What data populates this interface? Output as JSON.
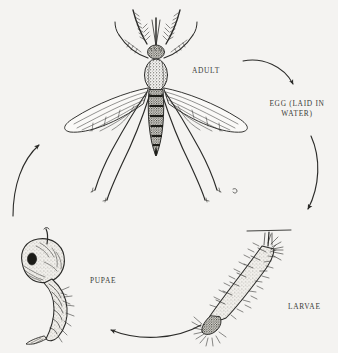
{
  "diagram": {
    "style": "pen-and-ink scientific illustration",
    "background_color": "#f4f3f1",
    "ink_color": "#2b2b29",
    "width": 338,
    "height": 353,
    "cycle_direction": "clockwise"
  },
  "labels": {
    "adult": "ADULT",
    "egg": "EGG (LAID IN\nWATER)",
    "larvae": "LARVAE",
    "pupae": "PUPAE"
  },
  "stages": [
    {
      "id": "adult",
      "label": "ADULT",
      "position": "top-center",
      "description": "Winged adult mosquito viewed from above with plumose antennae, long proboscis, stippled thorax, banded segmented abdomen, two veined wings and six long splayed legs"
    },
    {
      "id": "egg",
      "label": "EGG (LAID IN WATER)",
      "position": "right",
      "description": "Text-only stage label on the right side of the cycle"
    },
    {
      "id": "larvae",
      "label": "LARVAE",
      "position": "bottom-right",
      "description": "Bristly segmented larva hanging head-down at an angle from the horizontal water surface line by its breathing siphon, mouth brushes at the lower end"
    },
    {
      "id": "pupae",
      "label": "PUPAE",
      "position": "bottom-left",
      "description": "Comma-shaped pupa with large rounded cephalothorax bearing a dark eye spot and breathing trumpet, curving bristly abdomen ending in paddles"
    }
  ],
  "arrows": [
    {
      "id": "adult-to-egg",
      "from": "adult",
      "to": "egg",
      "position": "top-right",
      "direction": "curving down to the right"
    },
    {
      "id": "egg-to-larvae",
      "from": "egg",
      "to": "larvae",
      "position": "right",
      "direction": "curving downward"
    },
    {
      "id": "larvae-to-pupae",
      "from": "larvae",
      "to": "pupae",
      "position": "bottom",
      "direction": "curving left"
    },
    {
      "id": "pupae-to-adult",
      "from": "pupae",
      "to": "adult",
      "position": "left",
      "direction": "curving up to the right"
    }
  ],
  "annotations": {
    "water_surface_line": "horizontal water surface line above the larva"
  }
}
